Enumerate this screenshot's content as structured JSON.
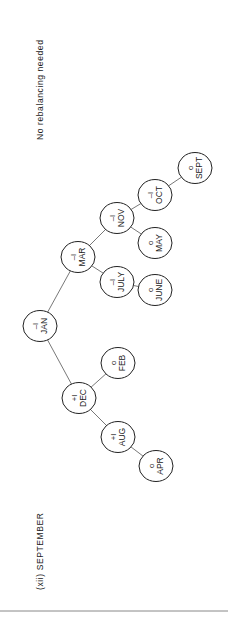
{
  "caption": "(xii) SEPTEMBER",
  "note": "No rebalancing needed",
  "tree": {
    "nodes": [
      {
        "id": "jan",
        "label": "JAN",
        "balance": "–I",
        "cx": 40,
        "cy": 326
      },
      {
        "id": "mar",
        "label": "MAR",
        "balance": "–I",
        "cx": 78,
        "cy": 257
      },
      {
        "id": "dec",
        "label": "DEC",
        "balance": "+I",
        "cx": 79,
        "cy": 398
      },
      {
        "id": "nov",
        "label": "NOV",
        "balance": "–I",
        "cx": 117,
        "cy": 218
      },
      {
        "id": "july",
        "label": "JULY",
        "balance": "–I",
        "cx": 117,
        "cy": 282
      },
      {
        "id": "feb",
        "label": "FEB",
        "balance": "o",
        "cx": 118,
        "cy": 363
      },
      {
        "id": "aug",
        "label": "AUG",
        "balance": "+I",
        "cx": 118,
        "cy": 437
      },
      {
        "id": "oct",
        "label": "OCT",
        "balance": "–I",
        "cx": 155,
        "cy": 195
      },
      {
        "id": "may",
        "label": "MAY",
        "balance": "o",
        "cx": 155,
        "cy": 243
      },
      {
        "id": "june",
        "label": "JUNE",
        "balance": "o",
        "cx": 155,
        "cy": 290
      },
      {
        "id": "apr",
        "label": "APR",
        "balance": "o",
        "cx": 156,
        "cy": 466
      },
      {
        "id": "sept",
        "label": "SEPT",
        "balance": "o",
        "cx": 195,
        "cy": 168
      }
    ],
    "edges": [
      [
        "jan",
        "mar"
      ],
      [
        "jan",
        "dec"
      ],
      [
        "mar",
        "nov"
      ],
      [
        "mar",
        "july"
      ],
      [
        "nov",
        "oct"
      ],
      [
        "nov",
        "may"
      ],
      [
        "oct",
        "sept"
      ],
      [
        "july",
        "june"
      ],
      [
        "dec",
        "feb"
      ],
      [
        "dec",
        "aug"
      ],
      [
        "aug",
        "apr"
      ]
    ]
  }
}
